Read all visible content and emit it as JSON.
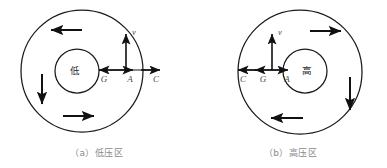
{
  "figure": {
    "background_color": "#ffffff",
    "line_color": "#1a1a1a",
    "label_color": "#4a4a4a",
    "caption_color": "#8a8a8a",
    "width": 387,
    "height": 168
  },
  "panels": [
    {
      "id": "panel-a",
      "caption": "（a）低压区",
      "center_label": "低",
      "center_label_meaning": "low pressure",
      "rotation_sense": "counterclockwise",
      "outer_circle": {
        "cx": 82,
        "cy": 71,
        "r": 61
      },
      "inner_circle": {
        "cx": 77,
        "cy": 71,
        "r": 22
      },
      "baseline_y": 70,
      "vector_labels": [
        {
          "name": "G",
          "text": "G",
          "x": 104,
          "y": 82,
          "direction": "left",
          "meaning": "pressure gradient force"
        },
        {
          "name": "A",
          "text": "A",
          "x": 130,
          "y": 82,
          "direction": "right",
          "meaning": "coriolis force"
        },
        {
          "name": "C",
          "text": "C",
          "x": 156,
          "y": 82,
          "direction": "right",
          "meaning": "resultant force"
        },
        {
          "name": "v",
          "text": "v",
          "x": 130,
          "y": 35,
          "direction": "up",
          "meaning": "wind velocity"
        }
      ],
      "ring_arrows": [
        {
          "name": "top-arrow",
          "direction": "left"
        },
        {
          "name": "left-arrow",
          "direction": "down"
        },
        {
          "name": "bottom-arrow",
          "direction": "right"
        }
      ]
    },
    {
      "id": "panel-b",
      "caption": "（b）高压区",
      "center_label": "高",
      "center_label_meaning": "high pressure",
      "rotation_sense": "clockwise",
      "outer_circle": {
        "cx": 300,
        "cy": 72,
        "r": 62
      },
      "inner_circle": {
        "cx": 305,
        "cy": 71,
        "r": 22
      },
      "baseline_y": 70,
      "vector_labels": [
        {
          "name": "C",
          "text": "C",
          "x": 243,
          "y": 82,
          "direction": "left",
          "meaning": "resultant force"
        },
        {
          "name": "G",
          "text": "G",
          "x": 263,
          "y": 82,
          "direction": "left",
          "meaning": "pressure gradient force"
        },
        {
          "name": "A",
          "text": "A",
          "x": 287,
          "y": 82,
          "direction": "right",
          "meaning": "coriolis force"
        },
        {
          "name": "v",
          "text": "v",
          "x": 272,
          "y": 35,
          "direction": "up",
          "meaning": "wind velocity"
        }
      ],
      "ring_arrows": [
        {
          "name": "top-arrow",
          "direction": "right"
        },
        {
          "name": "right-arrow",
          "direction": "down"
        },
        {
          "name": "bottom-arrow",
          "direction": "left"
        }
      ]
    }
  ]
}
